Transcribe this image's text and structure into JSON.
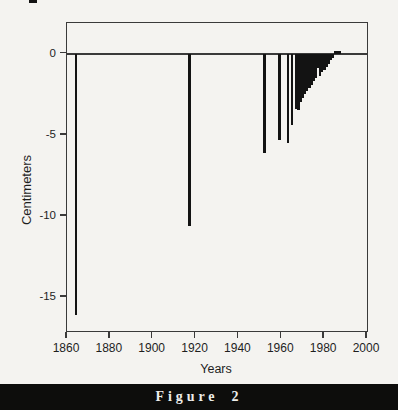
{
  "figure": {
    "caption": "Figure 2",
    "band_color": "#0d0d0c",
    "caption_color": "#ededeb",
    "background_color": "#f4f3f0"
  },
  "chart_data": {
    "type": "bar",
    "title": "",
    "xlabel": "Years",
    "ylabel": "Centimeters",
    "xlim": [
      1860,
      2000
    ],
    "ylim": [
      -17.1,
      1.9
    ],
    "x_ticks": [
      1860,
      1880,
      1900,
      1920,
      1940,
      1960,
      1980,
      2000
    ],
    "x_tick_labels": [
      "1860",
      "1880",
      "1900",
      "1920",
      "1940",
      "1960",
      "1980",
      "2000"
    ],
    "y_ticks": [
      0,
      -5,
      -10,
      -15
    ],
    "y_tick_labels": [
      "0",
      "-5",
      "-10",
      "-15"
    ],
    "grid": false,
    "legend": "none",
    "bar_color": "#131313",
    "axis_color": "#3a3a3a",
    "baseline_value": 0,
    "points": [
      {
        "year": 1864,
        "value": -16.1
      },
      {
        "year": 1917,
        "value": -10.6
      },
      {
        "year": 1952,
        "value": -6.1
      },
      {
        "year": 1959,
        "value": -5.3
      },
      {
        "year": 1963,
        "value": -5.5
      },
      {
        "year": 1965,
        "value": -4.4
      },
      {
        "year": 1967,
        "value": -3.4
      },
      {
        "year": 1968,
        "value": -3.45
      },
      {
        "year": 1969,
        "value": -3.0
      },
      {
        "year": 1970,
        "value": -2.7
      },
      {
        "year": 1971,
        "value": -2.5
      },
      {
        "year": 1972,
        "value": -2.3
      },
      {
        "year": 1973,
        "value": -2.1
      },
      {
        "year": 1974,
        "value": -1.9
      },
      {
        "year": 1975,
        "value": -1.7
      },
      {
        "year": 1976,
        "value": -1.5
      },
      {
        "year": 1977,
        "value": -0.9
      },
      {
        "year": 1978,
        "value": -1.35
      },
      {
        "year": 1979,
        "value": -1.15
      },
      {
        "year": 1980,
        "value": -1.0
      },
      {
        "year": 1981,
        "value": -0.8
      },
      {
        "year": 1982,
        "value": -0.6
      },
      {
        "year": 1983,
        "value": -0.4
      },
      {
        "year": 1984,
        "value": -0.25
      },
      {
        "year": 1985,
        "value": 0.2
      },
      {
        "year": 1986,
        "value": 0.2
      },
      {
        "year": 1987,
        "value": 0.15
      }
    ]
  }
}
